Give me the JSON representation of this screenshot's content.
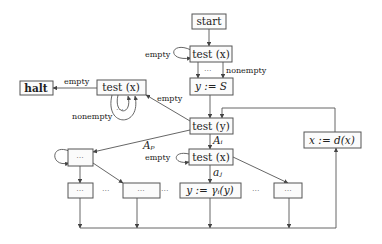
{
  "diagram": {
    "nodes": {
      "start": "start",
      "test_x_top": "test (x)",
      "assign_y_s": "y := S",
      "test_y": "test (y)",
      "halt": "halt",
      "test_x_left": "test (x)",
      "assign_x_dx": "x := d(x)",
      "test_x_mid": "test (x)",
      "ellipsis_box_left": "···",
      "row_box_1": "···",
      "row_box_2": "···",
      "assign_y_gamma": "y := γᵢ(y)",
      "row_box_4": "···"
    },
    "edge_labels": {
      "empty_top": "empty",
      "nonempty_top": "nonempty",
      "dots_top": "···",
      "empty_to_left": "empty",
      "empty_to_halt": "empty",
      "nonempty_left": "nonempty",
      "dots_left": "···",
      "A_p": "Aₚ",
      "A_i": "Aᵢ",
      "empty_mid": "empty",
      "a_j": "aⱼ"
    },
    "row_dots": [
      "···",
      "···",
      "···"
    ]
  }
}
